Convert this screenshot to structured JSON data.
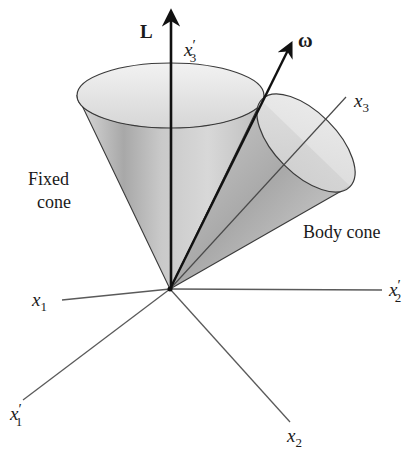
{
  "figure": {
    "vectors": {
      "L": {
        "label": "L",
        "style": "bold"
      },
      "omega": {
        "label": "ω",
        "style": "bold"
      }
    },
    "axes": {
      "x1": {
        "base": "x",
        "sub": "1",
        "prime": ""
      },
      "x2": {
        "base": "x",
        "sub": "2",
        "prime": ""
      },
      "x3": {
        "base": "x",
        "sub": "3",
        "prime": ""
      },
      "x1p": {
        "base": "x",
        "sub": "1",
        "prime": "′"
      },
      "x2p": {
        "base": "x",
        "sub": "2",
        "prime": "′"
      },
      "x3p": {
        "base": "x",
        "sub": "3",
        "prime": "′"
      }
    },
    "cones": {
      "fixed": {
        "line1": "Fixed",
        "line2": "cone"
      },
      "body": {
        "label": "Body cone"
      }
    },
    "colors": {
      "line": "#2a2a2a",
      "axis": "#555555",
      "cone_light": "#e6e6e6",
      "cone_dark": "#8c8c8c"
    }
  }
}
